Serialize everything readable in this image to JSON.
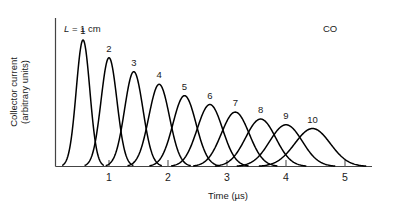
{
  "chart_data": {
    "type": "line",
    "title": "",
    "xlabel": "Time (µs)",
    "ylabel": "Collector current (arbitrary units)",
    "ylabel_line1": "Collector current",
    "ylabel_line2": "(arbitrary units)",
    "xlim": [
      0.0,
      5.4
    ],
    "ylim": [
      0,
      1.05
    ],
    "xticks": [
      1,
      2,
      3,
      4,
      5
    ],
    "xtick_labels": [
      "1",
      "2",
      "3",
      "4",
      "5"
    ],
    "yticks": [],
    "ytick_labels": [],
    "grid": false,
    "legend": "none",
    "annotations": [
      {
        "name": "length-annotation",
        "text": "L = 1 cm",
        "italic_prefix": "L",
        "rest": " = 1 cm",
        "x": 0.45,
        "y": 0.99
      },
      {
        "name": "species-annotation",
        "text": "CO",
        "x": 5.0,
        "y": 1.0
      }
    ],
    "series": [
      {
        "name": "peak-1",
        "label": "1",
        "center": 0.56,
        "amplitude": 1.0,
        "width": 0.115
      },
      {
        "name": "peak-2",
        "label": "2",
        "center": 1.0,
        "amplitude": 0.86,
        "width": 0.135
      },
      {
        "name": "peak-3",
        "label": "3",
        "center": 1.42,
        "amplitude": 0.75,
        "width": 0.155
      },
      {
        "name": "peak-4",
        "label": "4",
        "center": 1.85,
        "amplitude": 0.65,
        "width": 0.175
      },
      {
        "name": "peak-5",
        "label": "5",
        "center": 2.28,
        "amplitude": 0.56,
        "width": 0.195
      },
      {
        "name": "peak-6",
        "label": "6",
        "center": 2.71,
        "amplitude": 0.49,
        "width": 0.215
      },
      {
        "name": "peak-7",
        "label": "7",
        "center": 3.14,
        "amplitude": 0.43,
        "width": 0.235
      },
      {
        "name": "peak-8",
        "label": "8",
        "center": 3.57,
        "amplitude": 0.375,
        "width": 0.255
      },
      {
        "name": "peak-9",
        "label": "9",
        "center": 4.0,
        "amplitude": 0.33,
        "width": 0.275
      },
      {
        "name": "peak-10",
        "label": "10",
        "center": 4.45,
        "amplitude": 0.3,
        "width": 0.3
      }
    ],
    "peak_labels": [
      "1",
      "2",
      "3",
      "4",
      "5",
      "6",
      "7",
      "8",
      "9",
      "10"
    ],
    "colors": {
      "curve": "#000000",
      "axis": "#444444",
      "text": "#1a1a1a",
      "background": "#ffffff"
    }
  }
}
